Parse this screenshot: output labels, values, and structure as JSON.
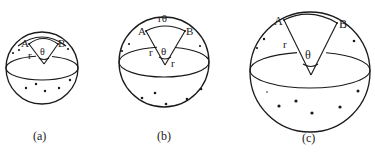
{
  "figure": {
    "colors": {
      "ink": "#1a1a1a",
      "background": "#ffffff"
    },
    "panels": [
      {
        "id": "a",
        "caption": "(a)",
        "point_a_label": "A",
        "point_b_label": "B",
        "radius_label": "r",
        "angle_label": "θ",
        "arc_label": ""
      },
      {
        "id": "b",
        "caption": "(b)",
        "point_a_label": "A",
        "point_b_label": "B",
        "radius_label": "r",
        "radius_label_2": "r",
        "angle_label": "θ",
        "arc_label": "rθ"
      },
      {
        "id": "c",
        "caption": "(c)",
        "point_a_label": "A",
        "point_b_label": "B",
        "radius_label": "r",
        "angle_label": "θ",
        "arc_label": ""
      }
    ]
  }
}
